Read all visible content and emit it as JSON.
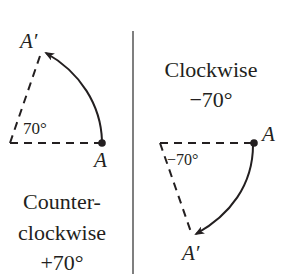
{
  "left_panel": {
    "point_label": "A",
    "rotated_point_label": "A′",
    "angle_label": "70°",
    "caption_line1": "Counter-",
    "caption_line2": "clockwise",
    "caption_line3": "+70°"
  },
  "right_panel": {
    "caption_line1": "Clockwise",
    "caption_line2": "−70°",
    "point_label": "A",
    "rotated_point_label": "A′",
    "angle_label": "−70°"
  },
  "colors": {
    "ink": "#231f20",
    "divider": "#555555",
    "background": "#ffffff"
  }
}
